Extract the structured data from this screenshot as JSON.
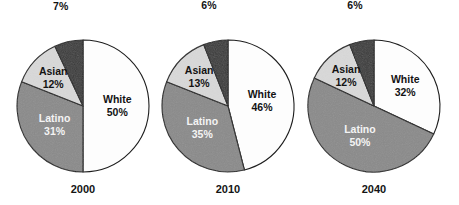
{
  "figure": {
    "title": "",
    "background_color": "#ffffff",
    "width": 459,
    "height": 205
  },
  "palette": {
    "white_slice": "#fdfdfd",
    "latino_slice": "#8a8a8a",
    "asian_slice": "#d9d9d9",
    "black_slice": "#3a3a3a",
    "outline": "#1d1d1d",
    "dark_text": "#131313",
    "light_text": "#f4f4f4"
  },
  "chart_data": {
    "type": "pie",
    "title": "",
    "xlabel": "",
    "ylabel": "",
    "legend_position": "none",
    "grid": false,
    "categories": [
      "White",
      "Latino",
      "Asian",
      "Black"
    ],
    "charts": [
      {
        "id": "pie-2000",
        "year_label": "2000",
        "center_x": 83,
        "center_y": 106,
        "radius": 66,
        "start_angle_deg": 0,
        "slices": [
          {
            "name": "White",
            "label": "White",
            "value": 50,
            "value_label": "50%",
            "color_key": "white_slice",
            "text_style": "dark-text",
            "label_mode": "inside",
            "label_radius_frac": 0.52
          },
          {
            "name": "Latino",
            "label": "Latino",
            "value": 31,
            "value_label": "31%",
            "color_key": "latino_slice",
            "text_style": "light-text",
            "label_mode": "inside",
            "label_radius_frac": 0.52
          },
          {
            "name": "Asian",
            "label": "Asian",
            "value": 12,
            "value_label": "12%",
            "color_key": "asian_slice",
            "text_style": "dark-text",
            "label_mode": "inside",
            "label_radius_frac": 0.62
          },
          {
            "name": "Black",
            "label": "Black",
            "value": 7,
            "value_label": "7%",
            "color_key": "black_slice",
            "text_style": "dark-text",
            "label_mode": "outside",
            "label_offset": 36
          }
        ]
      },
      {
        "id": "pie-2010",
        "year_label": "2010",
        "center_x": 228,
        "center_y": 106,
        "radius": 66,
        "start_angle_deg": 0,
        "slices": [
          {
            "name": "White",
            "label": "White",
            "value": 46,
            "value_label": "46%",
            "color_key": "white_slice",
            "text_style": "dark-text",
            "label_mode": "inside",
            "label_radius_frac": 0.52
          },
          {
            "name": "Latino",
            "label": "Latino",
            "value": 35,
            "value_label": "35%",
            "color_key": "latino_slice",
            "text_style": "light-text",
            "label_mode": "inside",
            "label_radius_frac": 0.52
          },
          {
            "name": "Asian",
            "label": "Asian",
            "value": 13,
            "value_label": "13%",
            "color_key": "asian_slice",
            "text_style": "dark-text",
            "label_mode": "inside",
            "label_radius_frac": 0.62
          },
          {
            "name": "Black",
            "label": "Black",
            "value": 6,
            "value_label": "6%",
            "color_key": "black_slice",
            "text_style": "dark-text",
            "label_mode": "outside",
            "label_offset": 36
          }
        ]
      },
      {
        "id": "pie-2040",
        "year_label": "2040",
        "center_x": 374,
        "center_y": 106,
        "radius": 66,
        "start_angle_deg": 0,
        "slices": [
          {
            "name": "White",
            "label": "White",
            "value": 32,
            "value_label": "32%",
            "color_key": "white_slice",
            "text_style": "dark-text",
            "label_mode": "inside",
            "label_radius_frac": 0.56
          },
          {
            "name": "Latino",
            "label": "Latino",
            "value": 50,
            "value_label": "50%",
            "color_key": "latino_slice",
            "text_style": "light-text",
            "label_mode": "inside",
            "label_radius_frac": 0.5
          },
          {
            "name": "Asian",
            "label": "Asian",
            "value": 12,
            "value_label": "12%",
            "color_key": "asian_slice",
            "text_style": "dark-text",
            "label_mode": "inside",
            "label_radius_frac": 0.62
          },
          {
            "name": "Black",
            "label": "Black",
            "value": 6,
            "value_label": "6%",
            "color_key": "black_slice",
            "text_style": "dark-text",
            "label_mode": "outside",
            "label_offset": 36
          }
        ]
      }
    ]
  }
}
